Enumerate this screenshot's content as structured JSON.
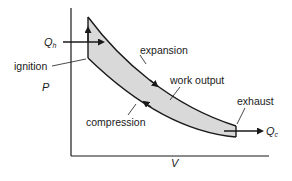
{
  "diagram": {
    "type": "P-V diagram (Otto cycle)",
    "axes": {
      "y_label": "P",
      "x_label": "V"
    },
    "labels": {
      "heat_in": "Q",
      "heat_in_sub": "h",
      "heat_out": "Q",
      "heat_out_sub": "c",
      "ignition": "ignition",
      "expansion": "expansion",
      "work_output": "work output",
      "exhaust": "exhaust",
      "compression": "compression"
    },
    "colors": {
      "line": "#1a1a1a",
      "fill": "#d9d9d9",
      "background": "#ffffff"
    }
  }
}
